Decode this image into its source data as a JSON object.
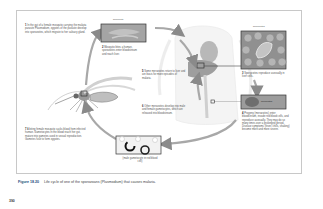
{
  "figure": {
    "steps": [
      {
        "num": "1",
        "text": "In the gut of a female mosquito carrying the malaria parasite Plasmodium, zygotes of the parasite develop into sporozoites, which migrate to her salivary gland."
      },
      {
        "num": "2",
        "text": "Mosquito bites a human, sporozoites enter bloodstream and reach liver."
      },
      {
        "num": "3",
        "text": "Sporozoites reproduce asexually in liver cells."
      },
      {
        "num": "4",
        "text": "Progeny (merozoites) enter bloodstream, invade red blood cells, and reproduce asexually. They may do so many times over a prolonged period. Disease symptoms (fever, chills, shaking) become more and more severe."
      },
      {
        "num": "5",
        "text": "Some merozoites return to liver and are basis for more episodes of malaria."
      },
      {
        "num": "6",
        "text": "Other merozoites develop into male and female gametocytes, which are released into bloodstream."
      },
      {
        "num": "7",
        "text": "A biting female mosquito sucks blood from infected human. Gametocytes in the blood reach her gut, mature into gametes used in sexual reproduction. Gametes fuse to form zygotes."
      }
    ],
    "labels": {
      "sporozoite_top": "sporozoite",
      "sporozoites_right": "sporozoites",
      "merozoites": "merozoites",
      "gametocyte": "(male gametocyte in red blood cell)"
    }
  },
  "caption": {
    "figure_label": "Figure 18.20",
    "text": "Life cycle of one of the sporozoans (Plasmodium) that causes malaria."
  },
  "page_number": "390",
  "colors": {
    "arrow": "#9a9a9a",
    "caption_label": "#1a4d7a",
    "panel_fill": "#a9a9a9",
    "frame": "#c8c8c8"
  }
}
